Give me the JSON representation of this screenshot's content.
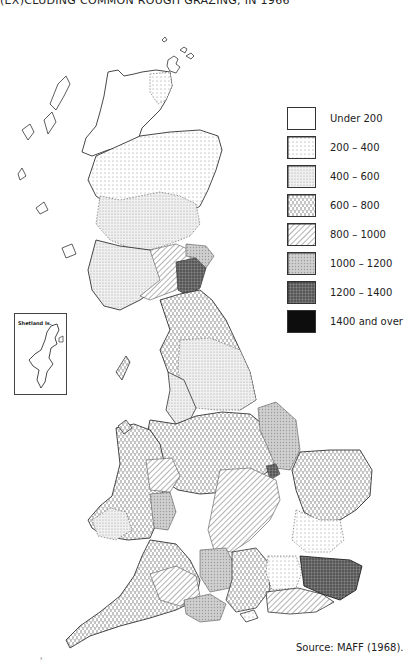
{
  "title": "(EX)CLUDING COMMON ROUGH GRAZING, IN 1966",
  "legend": {
    "items": [
      {
        "label": "Under 200",
        "pattern": "blank",
        "fill": "#ffffff"
      },
      {
        "label": "200 – 400",
        "pattern": "fine-dots",
        "fill": "#f3f3f3"
      },
      {
        "label": "400 – 600",
        "pattern": "dense-dots",
        "fill": "#e6e6e6"
      },
      {
        "label": "600 – 800",
        "pattern": "vertical-dashes",
        "fill": "#dedede"
      },
      {
        "label": "800 – 1000",
        "pattern": "diagonal-hatch",
        "fill": "#d2d2d2"
      },
      {
        "label": "1000 – 1200",
        "pattern": "grey-stipple",
        "fill": "#bdbdbd"
      },
      {
        "label": "1200 – 1400",
        "pattern": "dark-stipple",
        "fill": "#7a7a7a"
      },
      {
        "label": "1400 and over",
        "pattern": "solid",
        "fill": "#0d0d0d"
      }
    ]
  },
  "inset": {
    "label": "Shetland Is."
  },
  "source": "Source:  MAFF (1968).",
  "scan_mark": "ᶾ",
  "map": {
    "subject": "Great Britain counties choropleth",
    "highlighted_regions": [
      {
        "region": "Kent",
        "class": "1200 – 1400"
      },
      {
        "region": "Roxburgh/Berwick area",
        "class": "1200 – 1400"
      },
      {
        "region": "Lincolnshire (Lindsey)",
        "class": "1000 – 1200"
      },
      {
        "region": "Wiltshire/Dorset",
        "class": "1000 – 1200"
      },
      {
        "region": "Sussex",
        "class": "800 – 1000"
      },
      {
        "region": "Highlands",
        "class": "Under 200"
      }
    ]
  }
}
